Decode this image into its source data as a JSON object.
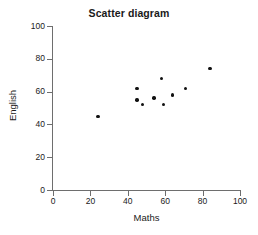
{
  "chart_data": {
    "type": "scatter",
    "title": "Scatter diagram",
    "xlabel": "Maths",
    "ylabel": "English",
    "xlim": [
      0,
      100
    ],
    "ylim": [
      0,
      100
    ],
    "xticks": [
      0,
      20,
      40,
      60,
      80,
      100
    ],
    "yticks": [
      0,
      20,
      40,
      60,
      80,
      100
    ],
    "xtick_labels": [
      "0",
      "20",
      "40",
      "60",
      "80",
      "100"
    ],
    "ytick_labels": [
      "0",
      "20",
      "40",
      "60",
      "80",
      "100"
    ],
    "grid": false,
    "legend": null,
    "marker": "filled-circle",
    "marker_color": "#111111",
    "points": [
      {
        "x": 24,
        "y": 45
      },
      {
        "x": 45,
        "y": 62
      },
      {
        "x": 45,
        "y": 55
      },
      {
        "x": 48,
        "y": 52
      },
      {
        "x": 54,
        "y": 56
      },
      {
        "x": 58,
        "y": 68
      },
      {
        "x": 59,
        "y": 52
      },
      {
        "x": 64,
        "y": 58
      },
      {
        "x": 71,
        "y": 62
      },
      {
        "x": 84,
        "y": 74
      }
    ],
    "series": [
      {
        "name": "Students",
        "x": [
          24,
          45,
          45,
          48,
          54,
          58,
          59,
          64,
          71,
          84
        ],
        "values": [
          45,
          62,
          55,
          52,
          56,
          68,
          52,
          58,
          62,
          74
        ]
      }
    ]
  }
}
